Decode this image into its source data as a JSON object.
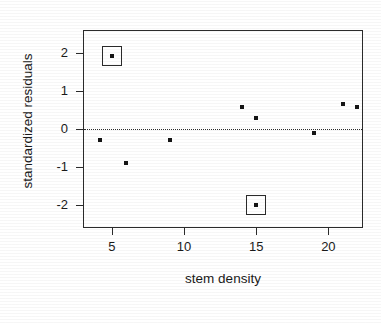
{
  "chart_data": {
    "type": "scatter",
    "title": "",
    "xlabel": "stem density",
    "ylabel": "standardized residuals",
    "xlim": [
      3.0,
      22.4
    ],
    "ylim": [
      -2.6,
      2.6
    ],
    "xticks": [
      5,
      10,
      15,
      20
    ],
    "xtick_labels": [
      "5",
      "10",
      "15",
      "20"
    ],
    "yticks": [
      2,
      1,
      0,
      -1,
      -2
    ],
    "ytick_labels": [
      "2",
      "1",
      "0",
      "-1",
      "-2"
    ],
    "grid": false,
    "legend": "none",
    "reference_lines": [
      {
        "name": "zero-residual-line",
        "orientation": "horizontal",
        "value": 0,
        "style": "dotted"
      }
    ],
    "marker": "star-dot",
    "points": [
      {
        "x": 4.2,
        "y": -0.3,
        "highlighted": false
      },
      {
        "x": 5.0,
        "y": 1.93,
        "highlighted": true
      },
      {
        "x": 6.0,
        "y": -0.88,
        "highlighted": false
      },
      {
        "x": 9.0,
        "y": -0.28,
        "highlighted": false
      },
      {
        "x": 14.0,
        "y": 0.58,
        "highlighted": false
      },
      {
        "x": 15.0,
        "y": 0.28,
        "highlighted": false
      },
      {
        "x": 15.0,
        "y": -2.0,
        "highlighted": true
      },
      {
        "x": 19.0,
        "y": -0.1,
        "highlighted": false
      },
      {
        "x": 21.0,
        "y": 0.65,
        "highlighted": false
      },
      {
        "x": 22.0,
        "y": 0.58,
        "highlighted": false
      }
    ],
    "highlight_style": "square-outline",
    "colors": {
      "marker": "#151515",
      "axis": "#2b2b2b",
      "highlight_box": "#2b2b2b",
      "background": "#ffffff",
      "text": "#1a1a1a"
    }
  }
}
